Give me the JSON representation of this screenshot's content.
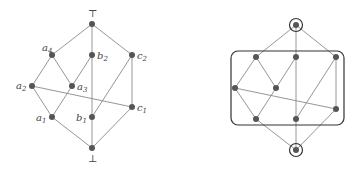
{
  "diagrams": [
    {
      "id": "lattice-labeled",
      "top_symbol": "⊤",
      "bottom_symbol": "⊥",
      "nodes": [
        {
          "id": "top",
          "x": 92,
          "y": 24,
          "label": ""
        },
        {
          "id": "a4",
          "x": 52,
          "y": 55,
          "label": "a",
          "sub": "4"
        },
        {
          "id": "b2",
          "x": 92,
          "y": 55,
          "label": "b",
          "sub": "2"
        },
        {
          "id": "c2",
          "x": 132,
          "y": 55,
          "label": "c",
          "sub": "2"
        },
        {
          "id": "a2",
          "x": 32,
          "y": 86,
          "label": "a",
          "sub": "2"
        },
        {
          "id": "a3",
          "x": 72,
          "y": 86,
          "label": "a",
          "sub": "3"
        },
        {
          "id": "c1",
          "x": 132,
          "y": 107,
          "label": "c",
          "sub": "1"
        },
        {
          "id": "a1",
          "x": 52,
          "y": 117,
          "label": "a",
          "sub": "1"
        },
        {
          "id": "b1",
          "x": 92,
          "y": 117,
          "label": "b",
          "sub": "1"
        },
        {
          "id": "bot",
          "x": 92,
          "y": 148,
          "label": ""
        }
      ],
      "edges": [
        [
          "top",
          "a4"
        ],
        [
          "top",
          "b2"
        ],
        [
          "top",
          "c2"
        ],
        [
          "a4",
          "a2"
        ],
        [
          "a4",
          "a3"
        ],
        [
          "b2",
          "a3"
        ],
        [
          "b2",
          "b1"
        ],
        [
          "c2",
          "c1"
        ],
        [
          "c2",
          "b1"
        ],
        [
          "a2",
          "c1"
        ],
        [
          "a2",
          "a1"
        ],
        [
          "a3",
          "a1"
        ],
        [
          "a1",
          "bot"
        ],
        [
          "b1",
          "bot"
        ],
        [
          "c1",
          "bot"
        ]
      ]
    },
    {
      "id": "lattice-grouped",
      "nodes": [
        "top",
        "a4",
        "b2",
        "c2",
        "a2",
        "a3",
        "c1",
        "a1",
        "b1",
        "bot"
      ],
      "highlighted": [
        "top",
        "bot"
      ],
      "group_box": {
        "x": 231,
        "y": 51,
        "width": 113,
        "height": 74,
        "rx": 7
      }
    }
  ]
}
